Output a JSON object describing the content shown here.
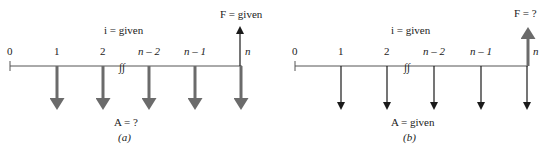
{
  "diagrams": [
    {
      "id": "a",
      "caption": "(a)",
      "interest_label": "i = given",
      "annuity_label": "A = ?",
      "future_label": "F = given",
      "period_labels": [
        "0",
        "1",
        "2",
        "n – 2",
        "n – 1",
        "n"
      ],
      "break_symbol": "∫∫",
      "arrow_style": {
        "down_color": "#6b6b6b",
        "down_width": "thick",
        "up_color": "#1a1a1a",
        "up_width": "thin"
      }
    },
    {
      "id": "b",
      "caption": "(b)",
      "interest_label": "i = given",
      "annuity_label": "A = given",
      "future_label": "F = ?",
      "period_labels": [
        "0",
        "1",
        "2",
        "n – 2",
        "n – 1",
        "n"
      ],
      "break_symbol": "∫∫",
      "arrow_style": {
        "down_color": "#1a1a1a",
        "down_width": "thin",
        "up_color": "#6b6b6b",
        "up_width": "thick"
      }
    }
  ],
  "colors": {
    "axis": "#555555",
    "thick_arrow": "#6b6b6b",
    "thin_arrow": "#1a1a1a",
    "text": "#222222"
  }
}
